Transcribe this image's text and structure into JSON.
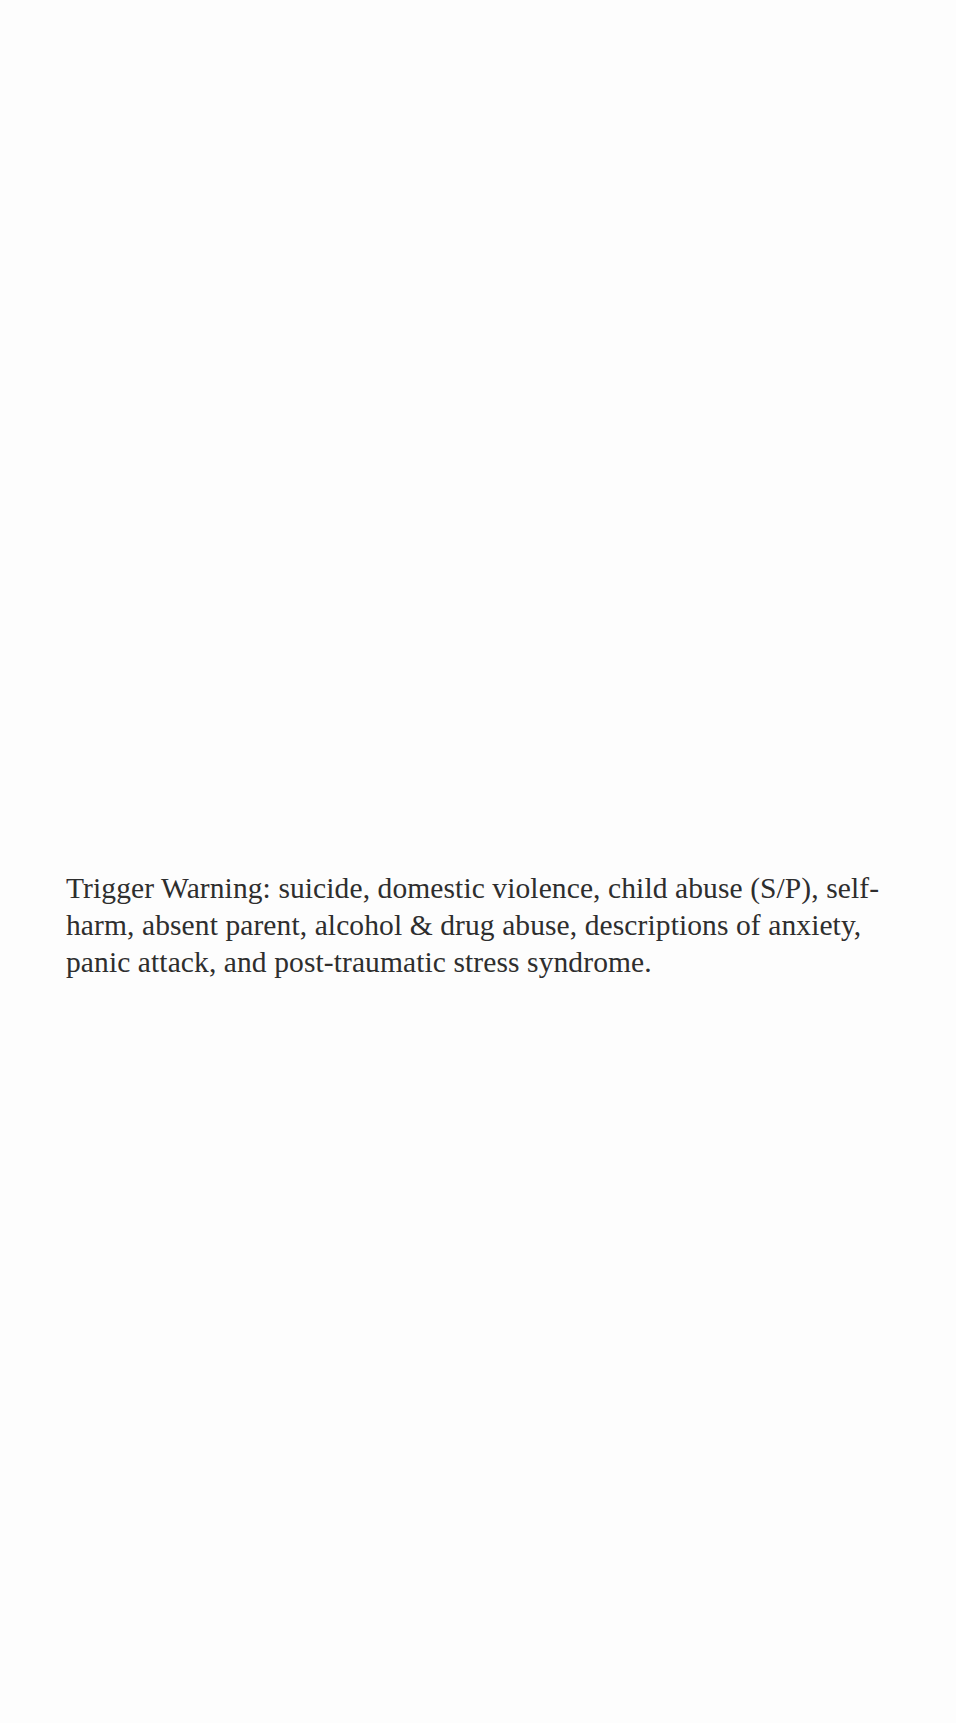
{
  "page": {
    "background": "#fdfdfd",
    "text_color": "#2e2e2e"
  },
  "content": {
    "trigger_warning": "Trigger Warning: suicide, domestic violence, child abuse (S/P), self-harm, absent parent, alcohol & drug abuse, descriptions of anxiety, panic attack, and post-traumatic stress syndrome."
  }
}
